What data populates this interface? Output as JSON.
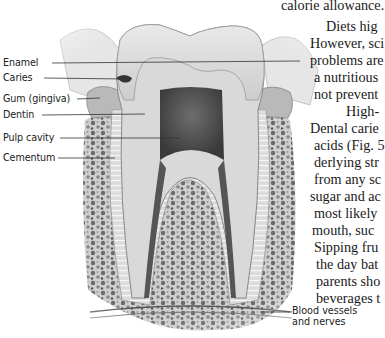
{
  "figure": {
    "labels": [
      {
        "id": "enamel",
        "text": "Enamel",
        "y": 57
      },
      {
        "id": "caries",
        "text": "Caries",
        "y": 72
      },
      {
        "id": "gum",
        "text": "Gum (gingiva)",
        "y": 93
      },
      {
        "id": "dentin",
        "text": "Dentin",
        "y": 109
      },
      {
        "id": "pulp",
        "text": "Pulp cavity",
        "y": 132
      },
      {
        "id": "cementum",
        "text": "Cementum",
        "y": 152
      }
    ],
    "bottom_label": {
      "line1": "Blood vessels",
      "line2": "and nerves"
    }
  },
  "body_text": {
    "lines": [
      {
        "text": "calorie allowance.",
        "x": 281,
        "y": -3
      },
      {
        "text": "Diets hig",
        "x": 326,
        "y": 18
      },
      {
        "text": "However, sci",
        "x": 310,
        "y": 35
      },
      {
        "text": "problems are",
        "x": 310,
        "y": 52
      },
      {
        "text": "a nutritious",
        "x": 314,
        "y": 69
      },
      {
        "text": "not prevent",
        "x": 314,
        "y": 86
      },
      {
        "text": "High-",
        "x": 346,
        "y": 103
      },
      {
        "text": "Dental carie",
        "x": 310,
        "y": 120
      },
      {
        "text": "acids (Fig. 5",
        "x": 314,
        "y": 137
      },
      {
        "text": "derlying str",
        "x": 314,
        "y": 154
      },
      {
        "text": "from any sc",
        "x": 314,
        "y": 171
      },
      {
        "text": "sugar and ac",
        "x": 310,
        "y": 188
      },
      {
        "text": "most likely",
        "x": 314,
        "y": 205
      },
      {
        "text": "mouth, suc",
        "x": 312,
        "y": 222
      },
      {
        "text": "Sipping fru",
        "x": 314,
        "y": 239
      },
      {
        "text": "the day bat",
        "x": 316,
        "y": 256
      },
      {
        "text": "parents sho",
        "x": 316,
        "y": 273
      },
      {
        "text": "beverages t",
        "x": 316,
        "y": 290
      }
    ]
  }
}
